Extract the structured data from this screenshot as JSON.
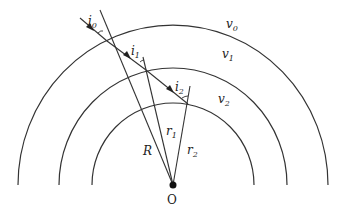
{
  "diagram": {
    "center": {
      "label": "O"
    },
    "layers": [
      {
        "speed_label": "v",
        "speed_sub": "0"
      },
      {
        "speed_label": "v",
        "speed_sub": "1"
      },
      {
        "speed_label": "v",
        "speed_sub": "2"
      }
    ],
    "angles": [
      {
        "label": "i",
        "sub": "0"
      },
      {
        "label": "i",
        "sub": "1"
      },
      {
        "label": "i",
        "sub": "2"
      }
    ],
    "radii": [
      {
        "label": "R"
      },
      {
        "label": "r",
        "sub": "1"
      },
      {
        "label": "r",
        "sub": "2"
      }
    ],
    "colors": {
      "stroke": "#333333",
      "background": "#ffffff"
    }
  }
}
